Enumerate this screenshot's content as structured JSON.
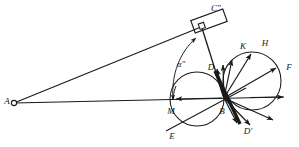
{
  "figure": {
    "kind": "geometric-kinematic-diagram",
    "background_color": "#ffffff",
    "stroke_color": "#1a1a1a",
    "width": 299,
    "height": 147
  },
  "labels": {
    "a_point": "A",
    "c_double_prime": "C\"",
    "alpha_double_prime": "α\"",
    "m_point": "M",
    "b_point": "B",
    "d_point": "D",
    "d_prime": "D'",
    "e_point": "E",
    "k_point": "K",
    "h_point": "H",
    "f_point": "F"
  },
  "geometry": {
    "point_a": {
      "x": 13,
      "y": 103
    },
    "point_b": {
      "x": 224,
      "y": 98
    },
    "point_m": {
      "x": 172,
      "y": 99
    },
    "pivot_c": {
      "x": 202,
      "y": 26
    },
    "left_circle": {
      "cx": 197,
      "cy": 99,
      "r": 27
    },
    "right_circle": {
      "cx": 252,
      "cy": 81,
      "r": 29
    },
    "plate_c": {
      "cx": 209,
      "cy": 21,
      "w": 34,
      "h": 13,
      "rotation": -20
    }
  },
  "label_positions": {
    "A": {
      "x": 7,
      "y": 102
    },
    "C\"": {
      "x": 214,
      "y": 9
    },
    "alpha": {
      "x": 181,
      "y": 65
    },
    "M": {
      "x": 171,
      "y": 111
    },
    "B": {
      "x": 222,
      "y": 111
    },
    "D": {
      "x": 211,
      "y": 69
    },
    "D'": {
      "x": 247,
      "y": 131
    },
    "E": {
      "x": 172,
      "y": 136
    },
    "K": {
      "x": 243,
      "y": 48
    },
    "H": {
      "x": 265,
      "y": 45
    },
    "F": {
      "x": 289,
      "y": 69
    }
  },
  "vectors_from_b": [
    {
      "name": "vector-b-to-d",
      "angle_deg": -104,
      "length": 30
    },
    {
      "name": "vector-b-to-k-inner",
      "angle_deg": -92,
      "length": 33
    },
    {
      "name": "vector-b-to-k",
      "angle_deg": -78,
      "length": 39
    },
    {
      "name": "vector-b-to-h",
      "angle_deg": -59,
      "length": 52
    },
    {
      "name": "vector-b-to-f-upper",
      "angle_deg": -30,
      "length": 60
    },
    {
      "name": "vector-b-to-f",
      "angle_deg": -3,
      "length": 62
    },
    {
      "name": "vector-b-lower-1",
      "angle_deg": 24,
      "length": 54
    },
    {
      "name": "vector-b-lower-2",
      "angle_deg": 46,
      "length": 38
    },
    {
      "name": "vector-b-lower-3",
      "angle_deg": 63,
      "length": 28
    }
  ],
  "annotations": {
    "arc_label_note": "angle arc from horizontal AB line up to rod B-C\"",
    "thick_bar_note": "heavy bar through B from D to D'",
    "arrow_m_note": "arrowhead on AB line pointing left at M"
  }
}
